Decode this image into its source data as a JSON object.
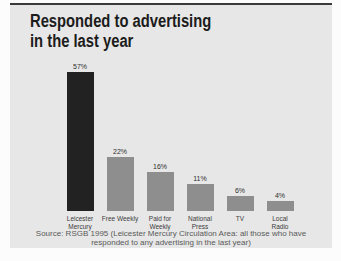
{
  "page": {
    "background": "#fcfcfc",
    "panel_background": "#e7e7e7",
    "top_rule_color": "#3a3a3a"
  },
  "title": "Responded to advertising\nin the last year",
  "source_note": "Source: RSGB 1995 (Leicester Mercury Circulation Area: all those who have\nresponded to any advertising in the last year)",
  "chart_data": {
    "type": "bar",
    "title": "Responded to advertising in the last year",
    "categories": [
      "Leicester Mercury",
      "Free Weekly",
      "Paid for Weekly",
      "National Press",
      "TV",
      "Local Radio"
    ],
    "values": [
      57,
      22,
      16,
      11,
      6,
      4
    ],
    "unit": "%",
    "value_labels": [
      "57%",
      "22%",
      "16%",
      "11%",
      "6%",
      "4%"
    ],
    "x_tick_labels": [
      "Leicester\nMercury",
      "Free Weekly",
      "Paid for\nWeekly",
      "National\nPress",
      "TV",
      "Local\nRadio"
    ],
    "bar_colors": [
      "#222222",
      "#8e8e8e",
      "#8e8e8e",
      "#8e8e8e",
      "#8e8e8e",
      "#8e8e8e"
    ],
    "highlight_color": "#222222",
    "default_bar_color": "#8e8e8e",
    "ylim": [
      0,
      60
    ],
    "grid": false,
    "legend": false,
    "xlabel": "",
    "ylabel": "",
    "source": "Source: RSGB 1995 (Leicester Mercury Circulation Area: all those who have responded to any advertising in the last year)"
  }
}
